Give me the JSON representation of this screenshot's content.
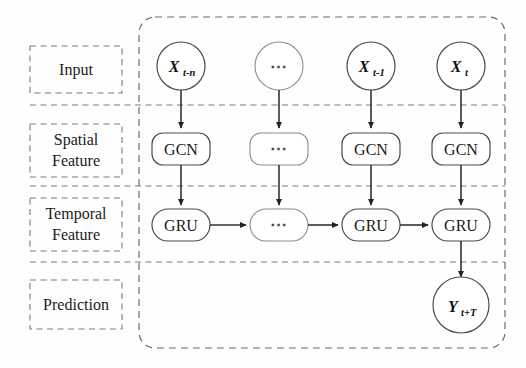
{
  "figure": {
    "type": "architecture-diagram",
    "background": "#fefefe"
  },
  "stages": [
    {
      "id": "input",
      "label": "Input"
    },
    {
      "id": "spatial",
      "label_line1": "Spatial",
      "label_line2": "Feature"
    },
    {
      "id": "temporal",
      "label_line1": "Temporal",
      "label_line2": "Feature"
    },
    {
      "id": "prediction",
      "label": "Prediction"
    }
  ],
  "columns": [
    {
      "id": "t-n",
      "input_var": "X",
      "input_sub": "t-n",
      "gcn": "GCN",
      "gru": "GRU"
    },
    {
      "id": "ellipsis",
      "input_var": "⋯",
      "input_sub": "",
      "gcn": "⋯",
      "gru": "⋯"
    },
    {
      "id": "t-1",
      "input_var": "X",
      "input_sub": "t-1",
      "gcn": "GCN",
      "gru": "GRU"
    },
    {
      "id": "t",
      "input_var": "X",
      "input_sub": "t",
      "gcn": "GCN",
      "gru": "GRU"
    }
  ],
  "output": {
    "var": "Y",
    "sub": "t+T"
  },
  "colors": {
    "node_stroke": "#4c4c4c",
    "dashed_stroke": "#6b6b6b",
    "arrow": "#333333",
    "text": "#1a1a1a"
  }
}
